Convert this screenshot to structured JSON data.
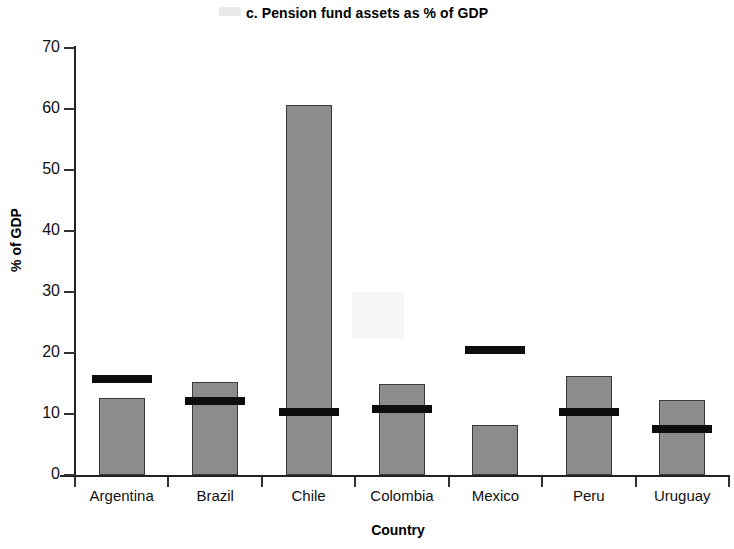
{
  "chart_data": {
    "type": "bar",
    "title": "c. Pension fund assets as % of GDP",
    "xlabel": "Country",
    "ylabel": "% of GDP",
    "ylim": [
      0,
      70
    ],
    "yticks": [
      0,
      10,
      20,
      30,
      40,
      50,
      60,
      70
    ],
    "grid": false,
    "legend": "none",
    "categories": [
      "Argentina",
      "Brazil",
      "Chile",
      "Colombia",
      "Mexico",
      "Peru",
      "Uruguay"
    ],
    "series": [
      {
        "name": "Pension fund assets as % of GDP",
        "style": "gray-bar",
        "color": "#8c8c8c",
        "values": [
          12.7,
          15.2,
          60.7,
          15.0,
          8.2,
          16.2,
          12.3
        ]
      },
      {
        "name": "Reference marker",
        "style": "black-bar-marker",
        "color": "#0d0d0d",
        "values": [
          15.8,
          12.1,
          10.3,
          10.8,
          20.5,
          10.4,
          7.6
        ]
      }
    ]
  },
  "axis": {
    "y_tick_labels": [
      "70",
      "60",
      "50",
      "40",
      "30",
      "20",
      "10",
      "0"
    ],
    "y_title": "% of GDP",
    "x_title": "Country"
  }
}
